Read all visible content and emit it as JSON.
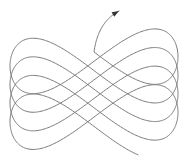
{
  "figure": {
    "colors": {
      "background": "#ffffff",
      "stroke": "#7a7a7a",
      "arrow": "#333333"
    },
    "curve": {
      "center_x": 94,
      "amplitude_x": 84,
      "amplitude_y": 30,
      "cycles": 4,
      "center_y_start": 128,
      "center_y_end": 52,
      "start_point": [
        49,
        145
      ],
      "end_point": [
        119,
        11
      ]
    }
  }
}
